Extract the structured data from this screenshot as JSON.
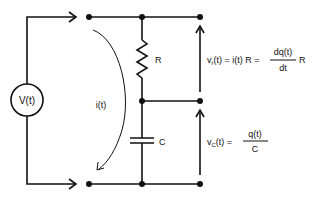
{
  "diagram": {
    "type": "circuit",
    "source": {
      "label": "V(t)"
    },
    "current": {
      "label": "i(t)"
    },
    "resistor": {
      "label": "R"
    },
    "capacitor": {
      "label": "C"
    },
    "resistor_voltage": {
      "lhs": "v",
      "lhs_sub": "r",
      "lhs_arg": "(t) = i(t) R =",
      "frac_num": "dq(t)",
      "frac_den": "dt",
      "tail": "R"
    },
    "capacitor_voltage": {
      "lhs": "v",
      "lhs_sub": "C",
      "lhs_arg": "(t) =",
      "frac_num": "q(t)",
      "frac_den": "C"
    }
  },
  "colors": {
    "stroke": "#111111",
    "background": "#ffffff"
  }
}
